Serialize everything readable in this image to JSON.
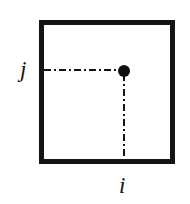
{
  "figure": {
    "background_color": "#ffffff",
    "ink_color": "#141414"
  },
  "frame": {
    "name": "matrix-boundary-square",
    "shape": "square",
    "stroke_color": "#141414",
    "stroke_width_px": 5,
    "fill_color": "#ffffff"
  },
  "node": {
    "name": "matrix-element-node",
    "shape": "filled-circle",
    "color": "#101010",
    "diameter_px": 12
  },
  "guides": [
    {
      "name": "guide-horizontal",
      "orientation": "horizontal",
      "style": "dash-dot",
      "color": "#141414",
      "from": "left-edge",
      "to": "node"
    },
    {
      "name": "guide-vertical",
      "orientation": "vertical",
      "style": "dash-dot",
      "color": "#141414",
      "from": "node",
      "to": "bottom-edge"
    }
  ],
  "labels": {
    "vertical_index": "j",
    "horizontal_index": "i"
  }
}
